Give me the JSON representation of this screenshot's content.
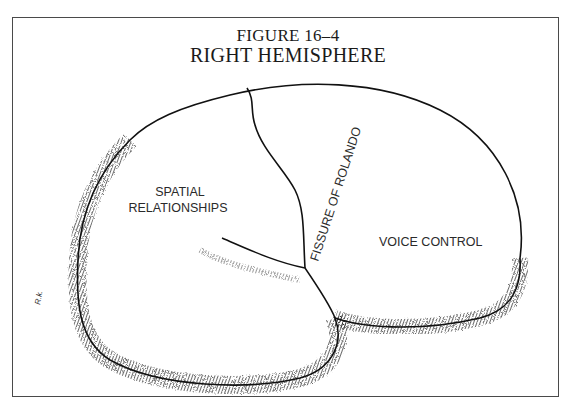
{
  "figure": {
    "number": "FIGURE 16–4",
    "title": "RIGHT HEMISPHERE"
  },
  "labels": {
    "spatial_line1": "SPATIAL",
    "spatial_line2": "RELATIONSHIPS",
    "fissure": "FISSURE OF ROLANDO",
    "voice": "VOICE CONTROL"
  },
  "colors": {
    "ink": "#111111",
    "frame": "#4a4a4a",
    "background": "#ffffff"
  }
}
